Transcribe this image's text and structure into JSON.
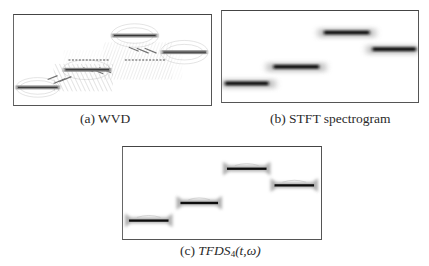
{
  "figure": {
    "panels": [
      {
        "id": "a",
        "label": "(a)",
        "title": "WVD",
        "caption": "(a) WVD",
        "method": "Wigner-Ville distribution",
        "features": [
          "auto-terms",
          "cross-terms (oscillatory interference)"
        ]
      },
      {
        "id": "b",
        "label": "(b)",
        "title": "STFT spectrogram",
        "caption": "(b) STFT spectrogram",
        "method": "Short-time Fourier transform spectrogram",
        "features": [
          "blurred auto-terms",
          "no cross-terms"
        ]
      },
      {
        "id": "c",
        "label": "(c)",
        "title_prefix": "TFDS",
        "title_subscript": "4",
        "title_suffix": "(t,ω)",
        "caption": "(c) TFDS4(t,ω)",
        "method": "TFDS order 4",
        "features": [
          "sharp auto-terms",
          "suppressed cross-terms"
        ]
      }
    ],
    "signal_segments": [
      {
        "index": 1,
        "t_start": 0.0,
        "t_end": 0.25,
        "relative_frequency": 0.18
      },
      {
        "index": 2,
        "t_start": 0.25,
        "t_end": 0.5,
        "relative_frequency": 0.38
      },
      {
        "index": 3,
        "t_start": 0.5,
        "t_end": 0.75,
        "relative_frequency": 0.78
      },
      {
        "index": 4,
        "t_start": 0.75,
        "t_end": 1.0,
        "relative_frequency": 0.58
      }
    ],
    "colors": {
      "background": "#ffffff",
      "frame": "#555555",
      "energy_peak": "#111111",
      "energy_blur": "#9a9a9a",
      "caption_text": "#2a2a2a"
    }
  }
}
